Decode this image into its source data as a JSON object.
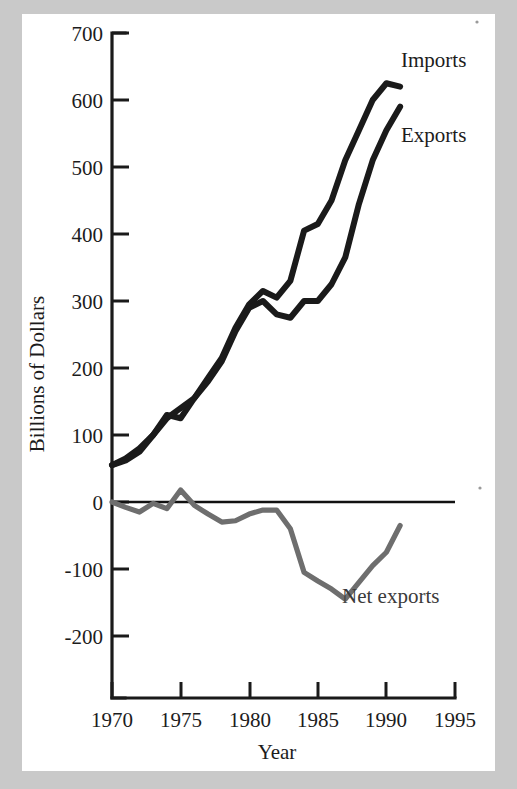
{
  "figure": {
    "background_color": "#c9c9c9",
    "sheet_color": "#ffffff",
    "ink_color": "#1a1a1a",
    "net_color": "#6e6e6e"
  },
  "labels": {
    "imports": "Imports",
    "exports": "Exports",
    "net_exports": "Net exports",
    "y_axis_title": "Billions of Dollars",
    "x_axis_title": "Year"
  },
  "axis": {
    "y_ticks": [
      "700",
      "600",
      "500",
      "400",
      "300",
      "200",
      "100",
      "0",
      "-100",
      "-200"
    ],
    "x_ticks": [
      "1970",
      "1975",
      "1980",
      "1985",
      "1990",
      "1995"
    ]
  },
  "chart_data": {
    "type": "line",
    "title": "",
    "subtitle": "",
    "xlabel": "Year",
    "ylabel": "Billions of Dollars",
    "xlim": [
      1970,
      1995
    ],
    "ylim": [
      -200,
      700
    ],
    "grid": false,
    "legend": "inline-annotations",
    "x": [
      1970,
      1971,
      1972,
      1973,
      1974,
      1975,
      1976,
      1977,
      1978,
      1979,
      1980,
      1981,
      1982,
      1983,
      1984,
      1985,
      1986,
      1987,
      1988,
      1989,
      1990,
      1991
    ],
    "series": [
      {
        "name": "Imports",
        "color": "#1a1a1a",
        "values": [
          55,
          65,
          80,
          100,
          130,
          125,
          155,
          185,
          215,
          260,
          295,
          315,
          305,
          330,
          405,
          415,
          450,
          510,
          555,
          600,
          625,
          620
        ]
      },
      {
        "name": "Exports",
        "color": "#1a1a1a",
        "values": [
          55,
          62,
          75,
          100,
          125,
          140,
          155,
          180,
          210,
          255,
          290,
          300,
          280,
          275,
          300,
          300,
          325,
          365,
          445,
          510,
          555,
          590
        ]
      },
      {
        "name": "Net exports",
        "color": "#6e6e6e",
        "values": [
          0,
          -8,
          -15,
          -2,
          -10,
          18,
          -5,
          -18,
          -30,
          -28,
          -18,
          -12,
          -12,
          -40,
          -105,
          -118,
          -130,
          -145,
          -120,
          -95,
          -75,
          -35
        ]
      }
    ]
  }
}
